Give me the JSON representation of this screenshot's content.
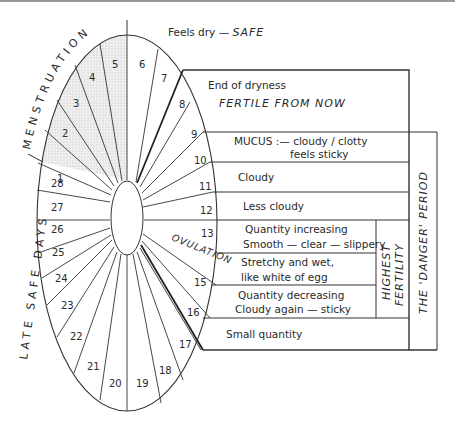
{
  "diagram": {
    "days": [
      "1",
      "2",
      "3",
      "4",
      "5",
      "6",
      "7",
      "8",
      "9",
      "10",
      "11",
      "12",
      "13",
      "14",
      "15",
      "16",
      "17",
      "18",
      "19",
      "20",
      "21",
      "22",
      "23",
      "24",
      "25",
      "26",
      "27",
      "28"
    ],
    "menstruation_label": "MENSTRUATION",
    "late_safe_label": "LATE SAFE DAYS",
    "ovulation_label": "OVULATION",
    "feels_dry": "Feels dry",
    "feels_dry_dash": "—",
    "safe": "SAFE",
    "end_of_dryness": "End of dryness",
    "fertile_from_now": "FERTILE FROM NOW",
    "rows": [
      {
        "line1": "MUCUS :—  cloudy / clotty",
        "line2": "feels sticky"
      },
      {
        "line1": "Cloudy"
      },
      {
        "line1": "Less cloudy"
      },
      {
        "line1": "Quantity increasing",
        "line2": "Smooth — clear — slippery"
      },
      {
        "line1": "Stretchy and wet,",
        "line2": "like white of egg"
      },
      {
        "line1": "Quantity decreasing",
        "line2": "Cloudy again — sticky"
      },
      {
        "line1": "Small quantity"
      }
    ],
    "highest_fertility_1": "HIGHEST",
    "highest_fertility_2": "FERTILITY",
    "danger_period": "THE 'DANGER' PERIOD",
    "colors": {
      "line": "#333333",
      "shade": "#e6e6e6",
      "text": "#2a2a2a"
    }
  }
}
